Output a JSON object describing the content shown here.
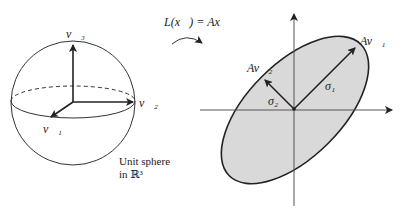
{
  "diagram": {
    "left": {
      "name": "unit-sphere",
      "vectors": [
        {
          "id": "v1",
          "label": "v⃗₁"
        },
        {
          "id": "v2",
          "label": "v⃗₂"
        },
        {
          "id": "v3",
          "label": "v⃗₃"
        }
      ],
      "caption_line1": "Unit sphere",
      "caption_line2": "in ℝ³"
    },
    "transform": {
      "label": "L(x⃗) = Ax⃗"
    },
    "right": {
      "name": "ellipse-image",
      "vectors": [
        {
          "id": "Av1",
          "label": "Av⃗₁"
        },
        {
          "id": "Av2",
          "label": "Av⃗₂"
        }
      ],
      "sigma1": "σ₁",
      "sigma2": "σ₂",
      "fill_color": "#d9d9d9",
      "stroke_color": "#222222"
    }
  }
}
